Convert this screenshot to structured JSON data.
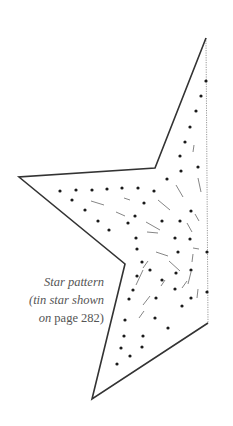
{
  "figure": {
    "type": "craft-pattern",
    "outline_color": "#333333",
    "dot_color": "#1a1a1a",
    "dash_color": "#777777",
    "fold_line_color": "#999999"
  },
  "caption": {
    "line1": "Star pattern",
    "line2": "(tin star shown",
    "line3_prefix": "on",
    "line3_suffix": " page 282)"
  },
  "outline": {
    "points": [
      [
        206,
        38
      ],
      [
        155,
        168
      ],
      [
        19,
        177
      ],
      [
        125,
        264
      ],
      [
        92,
        399
      ],
      [
        208,
        323
      ]
    ],
    "fold_line": [
      [
        206,
        38
      ],
      [
        208,
        323
      ]
    ]
  },
  "dots": [
    [
      206,
      81
    ],
    [
      201,
      96
    ],
    [
      196,
      111
    ],
    [
      190,
      127
    ],
    [
      185,
      142
    ],
    [
      180,
      156
    ],
    [
      198,
      167
    ],
    [
      181,
      171
    ],
    [
      167,
      179
    ],
    [
      60,
      191
    ],
    [
      76,
      190
    ],
    [
      92,
      190
    ],
    [
      107,
      189
    ],
    [
      122,
      188
    ],
    [
      138,
      188
    ],
    [
      154,
      191
    ],
    [
      72,
      200
    ],
    [
      144,
      203
    ],
    [
      191,
      211
    ],
    [
      85,
      210
    ],
    [
      135,
      216
    ],
    [
      98,
      221
    ],
    [
      128,
      223
    ],
    [
      162,
      221
    ],
    [
      180,
      221
    ],
    [
      109,
      230
    ],
    [
      136,
      238
    ],
    [
      175,
      238
    ],
    [
      190,
      239
    ],
    [
      137,
      249
    ],
    [
      178,
      252
    ],
    [
      142,
      262
    ],
    [
      150,
      270
    ],
    [
      137,
      276
    ],
    [
      162,
      280
    ],
    [
      176,
      273
    ],
    [
      191,
      270
    ],
    [
      133,
      290
    ],
    [
      175,
      289
    ],
    [
      191,
      298
    ],
    [
      129,
      299
    ],
    [
      156,
      298
    ],
    [
      182,
      306
    ],
    [
      125,
      320
    ],
    [
      155,
      318
    ],
    [
      168,
      328
    ],
    [
      124,
      336
    ],
    [
      143,
      336
    ],
    [
      121,
      348
    ],
    [
      130,
      356
    ],
    [
      117,
      364
    ],
    [
      142,
      347
    ],
    [
      207,
      252
    ],
    [
      207,
      292
    ]
  ],
  "dashes": [
    [
      194,
      145,
      193,
      152
    ],
    [
      198,
      178,
      201,
      192
    ],
    [
      176,
      185,
      183,
      197
    ],
    [
      91,
      201,
      104,
      205
    ],
    [
      124,
      198,
      130,
      200
    ],
    [
      158,
      200,
      170,
      210
    ],
    [
      116,
      212,
      125,
      216
    ],
    [
      195,
      214,
      199,
      221
    ],
    [
      146,
      222,
      160,
      230
    ],
    [
      147,
      232,
      158,
      233
    ],
    [
      187,
      223,
      192,
      232
    ],
    [
      193,
      248,
      199,
      249
    ],
    [
      156,
      252,
      168,
      256
    ],
    [
      169,
      261,
      180,
      271
    ],
    [
      193,
      254,
      192,
      262
    ],
    [
      191,
      272,
      188,
      284
    ],
    [
      143,
      268,
      148,
      261
    ],
    [
      182,
      288,
      187,
      281
    ],
    [
      161,
      286,
      165,
      280
    ],
    [
      136,
      285,
      143,
      270
    ],
    [
      198,
      289,
      197,
      298
    ],
    [
      143,
      305,
      150,
      296
    ],
    [
      139,
      318,
      144,
      311
    ]
  ]
}
